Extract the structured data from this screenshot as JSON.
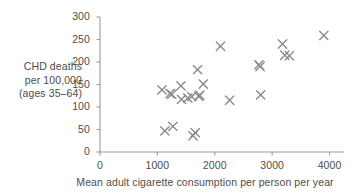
{
  "chart_data": {
    "type": "scatter",
    "title": "",
    "xlabel": "Mean adult cigarette consumption per person per year",
    "ylabel_lines": [
      "CHD deaths",
      "per 100,000",
      "(ages 35–64)"
    ],
    "xlim": [
      0,
      4200
    ],
    "ylim": [
      0,
      300
    ],
    "xticks": [
      0,
      1000,
      2000,
      3000,
      4000
    ],
    "xtick_labels": [
      "0",
      "1000",
      "2000",
      "3000",
      "4000"
    ],
    "yticks": [
      0,
      50,
      100,
      150,
      200,
      250,
      300
    ],
    "ytick_labels": [
      "0",
      "50",
      "100",
      "150",
      "200",
      "250",
      "300"
    ],
    "grid": false,
    "legend": null,
    "marker": "x",
    "marker_color": "#8a8a8a",
    "axis_color": "#9a9a9a",
    "text_color": "#4d4d4d",
    "points": [
      {
        "x": 1080,
        "y": 138
      },
      {
        "x": 1130,
        "y": 47
      },
      {
        "x": 1220,
        "y": 130
      },
      {
        "x": 1250,
        "y": 128
      },
      {
        "x": 1270,
        "y": 57
      },
      {
        "x": 1410,
        "y": 147
      },
      {
        "x": 1420,
        "y": 117
      },
      {
        "x": 1530,
        "y": 120
      },
      {
        "x": 1600,
        "y": 123
      },
      {
        "x": 1620,
        "y": 36
      },
      {
        "x": 1660,
        "y": 43
      },
      {
        "x": 1700,
        "y": 183
      },
      {
        "x": 1720,
        "y": 124
      },
      {
        "x": 1740,
        "y": 126
      },
      {
        "x": 1800,
        "y": 151
      },
      {
        "x": 2100,
        "y": 235
      },
      {
        "x": 2260,
        "y": 115
      },
      {
        "x": 2770,
        "y": 194
      },
      {
        "x": 2790,
        "y": 190
      },
      {
        "x": 2800,
        "y": 127
      },
      {
        "x": 3180,
        "y": 240
      },
      {
        "x": 3220,
        "y": 215
      },
      {
        "x": 3300,
        "y": 214
      },
      {
        "x": 3900,
        "y": 259
      }
    ]
  }
}
